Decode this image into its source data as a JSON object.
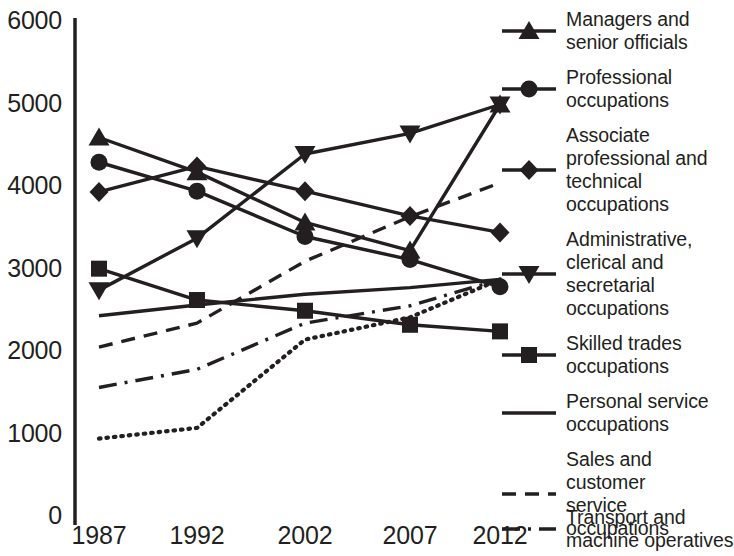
{
  "chart_data": {
    "type": "line",
    "title": "",
    "xlabel": "",
    "ylabel": "",
    "categories": [
      "1987",
      "1992",
      "2002",
      "2007",
      "2012"
    ],
    "x_tick_labels": [
      "1987",
      "1992",
      "2002",
      "2007",
      "2012"
    ],
    "y_tick_labels": [
      "0",
      "1000",
      "2000",
      "3000",
      "4000",
      "5000",
      "6000"
    ],
    "y_ticks": [
      0,
      1000,
      2000,
      3000,
      4000,
      5000,
      6000
    ],
    "ylim": [
      0,
      6000
    ],
    "grid": false,
    "legend_position": "right",
    "series": [
      {
        "name": "Managers and senior officials",
        "marker": "triangle-up",
        "line_style": "solid",
        "values": [
          4600,
          4180,
          3570,
          3230,
          5000
        ]
      },
      {
        "name": "Professional occupations",
        "marker": "circle",
        "line_style": "solid",
        "values": [
          4300,
          3950,
          3400,
          3120,
          2790
        ]
      },
      {
        "name": "Associate professional and technical occupations",
        "marker": "diamond",
        "line_style": "solid",
        "values": [
          3940,
          4250,
          3950,
          3650,
          3450
        ]
      },
      {
        "name": "Administrative, clerical and secretarial occupations",
        "marker": "triangle-down",
        "line_style": "solid",
        "values": [
          2750,
          3380,
          4400,
          4650,
          5000
        ]
      },
      {
        "name": "Skilled trades occupations",
        "marker": "square",
        "line_style": "solid",
        "values": [
          3010,
          2630,
          2500,
          2330,
          2250
        ]
      },
      {
        "name": "Personal service occupations",
        "marker": "none",
        "line_style": "solid",
        "values": [
          2440,
          2570,
          2700,
          2780,
          2880
        ]
      },
      {
        "name": "Sales and customer service occupations",
        "marker": "none",
        "line_style": "dashed",
        "values": [
          2060,
          2350,
          3100,
          3640,
          4050
        ]
      },
      {
        "name": "Transport and machine operatives",
        "marker": "none",
        "line_style": "dash-dot",
        "values": [
          1570,
          1790,
          2350,
          2560,
          2880
        ]
      },
      {
        "name": "Elementary occupations",
        "marker": "none",
        "line_style": "dotted",
        "values": [
          950,
          1080,
          2150,
          2420,
          2880
        ]
      }
    ]
  },
  "legend": {
    "items": [
      {
        "label_lines": [
          "Managers and",
          "senior officials"
        ],
        "key": "triangle-up-solid-key"
      },
      {
        "label_lines": [
          "Professional",
          "occupations"
        ],
        "key": "circle-solid-key"
      },
      {
        "label_lines": [
          "Associate",
          "professional and",
          "technical",
          "occupations"
        ],
        "key": "diamond-solid-key"
      },
      {
        "label_lines": [
          "Administrative,",
          "clerical and",
          "secretarial",
          "occupations"
        ],
        "key": "triangle-down-solid-key"
      },
      {
        "label_lines": [
          "Skilled trades",
          "occupations"
        ],
        "key": "square-solid-key"
      },
      {
        "label_lines": [
          "Personal service",
          "occupations"
        ],
        "key": "plain-solid-key"
      },
      {
        "label_lines": [
          "Sales and customer",
          "service occupations"
        ],
        "key": "dashed-key"
      },
      {
        "label_lines": [
          "Transport and",
          "machine operatives"
        ],
        "key": "dash-dot-key"
      },
      {
        "label_lines": [
          "Elementary",
          "occupations"
        ],
        "key": "dotted-key"
      }
    ]
  },
  "colors": {
    "ink": "#231f20",
    "background": "#ffffff"
  }
}
